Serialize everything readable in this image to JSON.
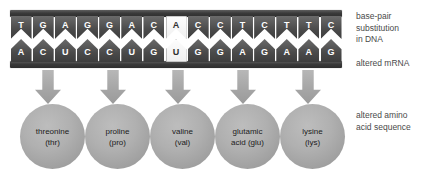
{
  "strand": {
    "dna_row_label": "DNA (coding strand)",
    "mrna_row_label": "mRNA",
    "substituted_index": 7,
    "pairs": [
      {
        "dna": "T",
        "mrna": "A",
        "substituted": false
      },
      {
        "dna": "G",
        "mrna": "C",
        "substituted": false
      },
      {
        "dna": "A",
        "mrna": "U",
        "substituted": false
      },
      {
        "dna": "G",
        "mrna": "C",
        "substituted": false
      },
      {
        "dna": "G",
        "mrna": "C",
        "substituted": false
      },
      {
        "dna": "A",
        "mrna": "U",
        "substituted": false
      },
      {
        "dna": "C",
        "mrna": "G",
        "substituted": false
      },
      {
        "dna": "A",
        "mrna": "U",
        "substituted": true
      },
      {
        "dna": "C",
        "mrna": "G",
        "substituted": false
      },
      {
        "dna": "C",
        "mrna": "G",
        "substituted": false
      },
      {
        "dna": "T",
        "mrna": "A",
        "substituted": false
      },
      {
        "dna": "C",
        "mrna": "G",
        "substituted": false
      },
      {
        "dna": "T",
        "mrna": "A",
        "substituted": false
      },
      {
        "dna": "T",
        "mrna": "A",
        "substituted": false
      },
      {
        "dna": "C",
        "mrna": "G",
        "substituted": false
      }
    ]
  },
  "arrows": [
    {
      "name": "arrow-to-threonine"
    },
    {
      "name": "arrow-to-proline"
    },
    {
      "name": "arrow-to-valine"
    },
    {
      "name": "arrow-to-glutamic-acid"
    },
    {
      "name": "arrow-to-lysine"
    }
  ],
  "amino_acids": [
    {
      "name": "threonine",
      "abbr": "(thr)"
    },
    {
      "name": "proline",
      "abbr": "(pro)"
    },
    {
      "name": "valine",
      "abbr": "(val)"
    },
    {
      "name": "glutamic",
      "abbr": "acid (glu)"
    },
    {
      "name": "lysine",
      "abbr": "(lys)"
    }
  ],
  "notes": {
    "dna": "base-pair\nsubstitution\nin DNA",
    "mrna": "altered mRNA",
    "amino": "altered amino\nacid sequence"
  },
  "colors": {
    "background": "#ffffff",
    "backbone": "#3a3a3a",
    "base_fill": "#4a4a4a",
    "base_text": "#ffffff",
    "substituted_fill": "#f5f5f5",
    "substituted_text": "#2f2f2f",
    "arrow": "#ababab",
    "circle": "#ababab",
    "label_text": "#4a4a4a"
  }
}
